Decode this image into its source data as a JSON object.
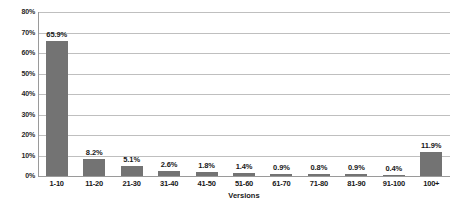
{
  "chart_data": {
    "type": "bar",
    "title": "",
    "subtitle": "",
    "xlabel": "Versions",
    "ylabel": "",
    "categories": [
      "1-10",
      "11-20",
      "21-30",
      "31-40",
      "41-50",
      "51-60",
      "61-70",
      "71-80",
      "81-90",
      "91-100",
      "100+"
    ],
    "values": [
      65.9,
      8.2,
      5.1,
      2.6,
      1.8,
      1.4,
      0.9,
      0.8,
      0.9,
      0.4,
      11.9
    ],
    "data_labels": [
      "65.9%",
      "8.2%",
      "5.1%",
      "2.6%",
      "1.8%",
      "1.4%",
      "0.9%",
      "0.8%",
      "0.9%",
      "0.4%",
      "11.9%"
    ],
    "ylim": [
      0,
      80
    ],
    "ytick_values": [
      0,
      10,
      20,
      30,
      40,
      50,
      60,
      70,
      80
    ],
    "ytick_labels": [
      "0%",
      "10%",
      "20%",
      "30%",
      "40%",
      "50%",
      "60%",
      "70%",
      "80%"
    ],
    "grid": "horizontal",
    "legend": "none",
    "bar_color": "#737373",
    "gridline_color": "#bfbfbf",
    "axis_color": "#9a9a9a",
    "background_color": "#ffffff"
  }
}
